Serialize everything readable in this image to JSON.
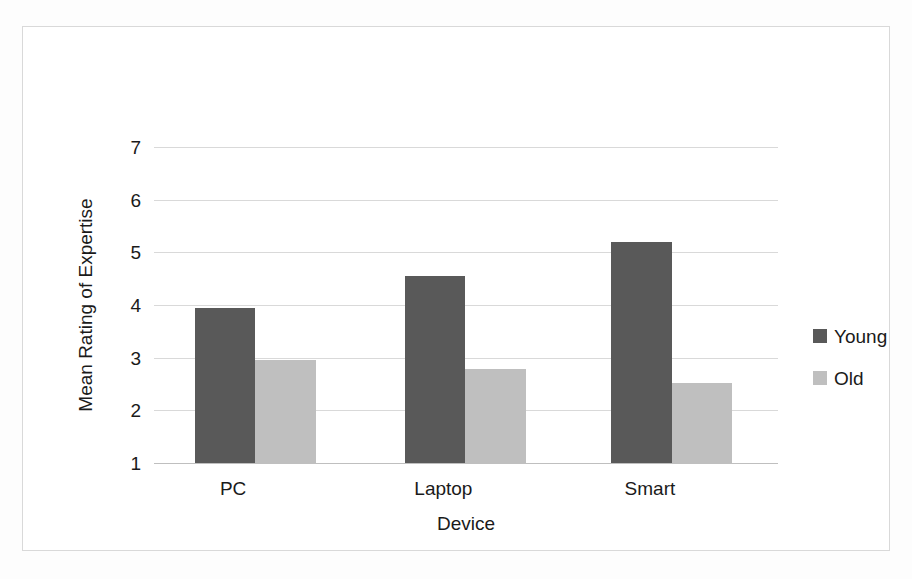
{
  "chart_data": {
    "type": "bar",
    "title": "",
    "subtitle": "",
    "xlabel": "Device",
    "ylabel": "Mean Rating of Expertise",
    "categories": [
      "PC",
      "Laptop",
      "Smart"
    ],
    "series": [
      {
        "name": "Young",
        "color": "#595959",
        "values": [
          3.95,
          4.55,
          5.19
        ]
      },
      {
        "name": "Old",
        "color": "#bfbfbf",
        "values": [
          2.96,
          2.78,
          2.52
        ]
      }
    ],
    "ylim": [
      1,
      7
    ],
    "yticks": [
      1,
      2,
      3,
      4,
      5,
      6,
      7
    ],
    "ytick_labels": [
      "1",
      "2",
      "3",
      "4",
      "5",
      "6",
      "7"
    ],
    "grid": true,
    "grid_axis": "y",
    "legend_position": "right",
    "plot_border": true,
    "annotations": []
  },
  "axes": {
    "y_title": "Mean Rating of Expertise",
    "x_title": "Device"
  },
  "legend": {
    "entries": [
      {
        "label": "Young",
        "color": "#595959"
      },
      {
        "label": "Old",
        "color": "#bfbfbf"
      }
    ]
  },
  "colors": {
    "series_young": "#595959",
    "series_old": "#bfbfbf",
    "gridline": "#d9d9d9",
    "frame": "#d9d9d9",
    "text": "#1a1a1a",
    "background": "#fdfdfd"
  }
}
